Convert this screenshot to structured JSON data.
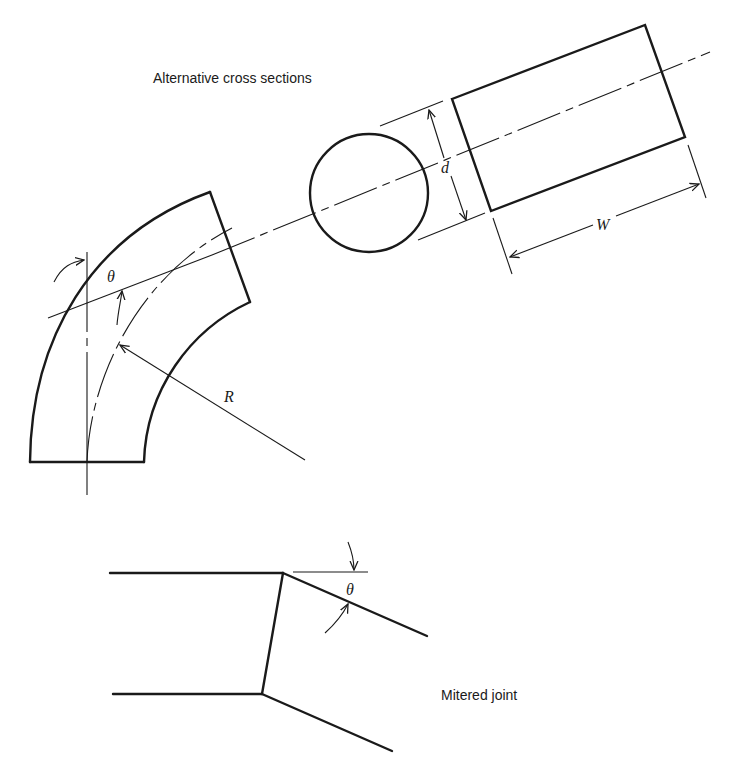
{
  "labels": {
    "cross_sections_caption": "Alternative cross sections",
    "mitered_caption": "Mitered joint",
    "theta_bend": "θ",
    "theta_miter": "θ",
    "radius": "R",
    "diameter": "d",
    "width": "W"
  },
  "parts": [
    {
      "name": "smooth-bend",
      "description": "Curved pipe bend with bend angle θ and radius R"
    },
    {
      "name": "circular-cross-section",
      "dimension": "d"
    },
    {
      "name": "rectangular-cross-section",
      "dimensions": [
        "d",
        "W"
      ]
    },
    {
      "name": "mitered-joint",
      "angle": "θ"
    }
  ],
  "colors": {
    "ink": "#1a1a1a",
    "background": "#ffffff"
  }
}
